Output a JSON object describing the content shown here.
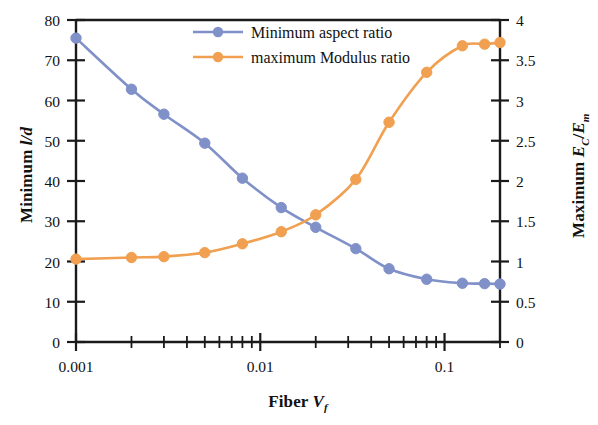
{
  "chart_data": {
    "type": "line",
    "title": "",
    "xlabel": "Fiber Vf",
    "xlabel_parts": {
      "text": "Fiber ",
      "var": "V",
      "sub": "f"
    },
    "ylabel_left": "Minimum l/d",
    "ylabel_left_parts": {
      "text": "Minimum ",
      "var": "l/d"
    },
    "ylabel_right": "Maximum EC/Em",
    "ylabel_right_parts": {
      "text": "Maximum ",
      "var1": "E",
      "sub1": "C",
      "slash": "/",
      "var2": "E",
      "sub2": "m"
    },
    "xscale": "log",
    "xlim": [
      0.001,
      0.2
    ],
    "xticks_major": [
      "0.001",
      "0.01",
      "0.1"
    ],
    "xtick_major_values": [
      0.001,
      0.01,
      0.1
    ],
    "ylim_left": [
      0,
      80
    ],
    "yticks_left": [
      "0",
      "10",
      "20",
      "30",
      "40",
      "50",
      "60",
      "70",
      "80"
    ],
    "ytick_left_values": [
      0,
      10,
      20,
      30,
      40,
      50,
      60,
      70,
      80
    ],
    "ylim_right": [
      0,
      4
    ],
    "yticks_right": [
      "0",
      "0.5",
      "1",
      "1.5",
      "2",
      "2.5",
      "3",
      "3.5",
      "4"
    ],
    "ytick_right_values": [
      0,
      0.5,
      1,
      1.5,
      2,
      2.5,
      3,
      3.5,
      4
    ],
    "grid": false,
    "legend_position": "top-center",
    "series": [
      {
        "name": "Minimum aspect ratio",
        "axis": "left",
        "color": "#8090C8",
        "marker": "circle",
        "x": [
          0.001,
          0.002,
          0.003,
          0.005,
          0.008,
          0.013,
          0.02,
          0.033,
          0.05,
          0.08,
          0.125,
          0.165,
          0.2
        ],
        "y": [
          75.5,
          62.8,
          56.6,
          49.4,
          40.7,
          33.4,
          28.5,
          23.2,
          18.2,
          15.6,
          14.6,
          14.5,
          14.4
        ]
      },
      {
        "name": "maximum Modulus ratio",
        "axis": "right",
        "color": "#F0A050",
        "marker": "circle",
        "x": [
          0.001,
          0.002,
          0.003,
          0.005,
          0.008,
          0.013,
          0.02,
          0.033,
          0.05,
          0.08,
          0.125,
          0.165,
          0.2
        ],
        "y": [
          1.03,
          1.05,
          1.06,
          1.11,
          1.22,
          1.37,
          1.58,
          2.02,
          2.73,
          3.35,
          3.68,
          3.7,
          3.72
        ]
      }
    ]
  },
  "legend": {
    "entries": [
      {
        "label": "Minimum aspect ratio",
        "color": "#8090C8"
      },
      {
        "label": "maximum Modulus ratio",
        "color": "#F0A050"
      }
    ]
  },
  "colors": {
    "series_blue": "#8090C8",
    "series_orange": "#F0A050",
    "axis": "#1a1a1a",
    "background": "#ffffff"
  }
}
